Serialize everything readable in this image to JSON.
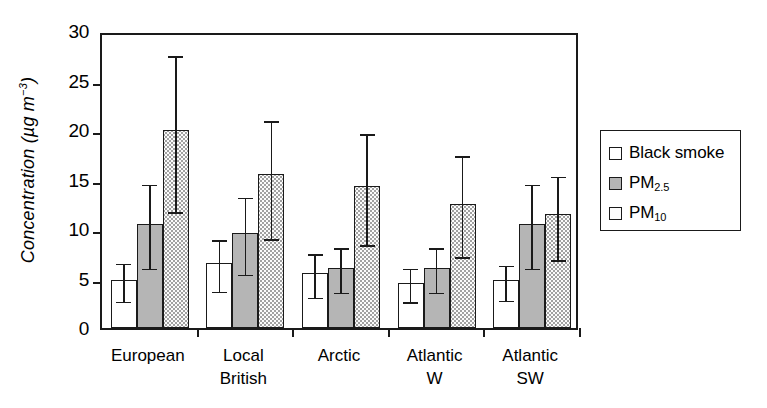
{
  "chart_data": {
    "type": "bar",
    "title": "",
    "xlabel": "",
    "ylabel": "Concentration (µg m−3)",
    "ylabel_parts": {
      "text": "Concentration (µg m",
      "sup": "−3",
      "tail": ")"
    },
    "ylim": [
      0,
      30
    ],
    "yticks": [
      0,
      5,
      10,
      15,
      20,
      25,
      30
    ],
    "ytick_labels": [
      "0",
      "5",
      "10",
      "15",
      "20",
      "25",
      "30"
    ],
    "grid": false,
    "error_bars": "whiskers with caps (standard deviation)",
    "categories": [
      "European",
      "Local British",
      "Arctic",
      "Atlantic W",
      "Atlantic SW"
    ],
    "category_lines": [
      [
        "European"
      ],
      [
        "Local",
        "British"
      ],
      [
        "Arctic"
      ],
      [
        "Atlantic",
        "W"
      ],
      [
        "Atlantic",
        "SW"
      ]
    ],
    "legend_position": "right, outside plot",
    "series": [
      {
        "name": "Black smoke",
        "key": "black-smoke",
        "fill": "white",
        "color": "#ffffff",
        "values": [
          4.9,
          6.6,
          5.6,
          4.5,
          4.8
        ],
        "err_low": [
          3.0,
          4.0,
          3.4,
          2.9,
          3.1
        ],
        "err_high": [
          6.8,
          9.2,
          7.8,
          6.3,
          6.6
        ]
      },
      {
        "name": "PM2.5",
        "label_main": "PM",
        "label_sub": "2.5",
        "key": "pm25",
        "fill": "grey",
        "color": "#b5b5b5",
        "values": [
          10.5,
          9.6,
          6.1,
          6.1,
          10.5
        ],
        "err_low": [
          6.3,
          5.7,
          3.9,
          3.9,
          6.3
        ],
        "err_high": [
          14.8,
          13.5,
          8.4,
          8.4,
          14.8
        ]
      },
      {
        "name": "PM10",
        "label_main": "PM",
        "label_sub": "10",
        "key": "pm10",
        "fill": "dotted",
        "color": "#fbfbfb",
        "values": [
          20.0,
          15.6,
          14.3,
          12.5,
          11.5
        ],
        "err_low": [
          12.0,
          9.3,
          8.7,
          7.5,
          7.2
        ],
        "err_high": [
          27.8,
          21.2,
          19.9,
          17.7,
          15.6
        ]
      }
    ]
  },
  "legend": {
    "items": [
      {
        "label": "Black smoke",
        "swatch": "black-smoke"
      },
      {
        "label": "PM2.5",
        "swatch": "pm25"
      },
      {
        "label": "PM10",
        "swatch": "pm10"
      }
    ]
  }
}
